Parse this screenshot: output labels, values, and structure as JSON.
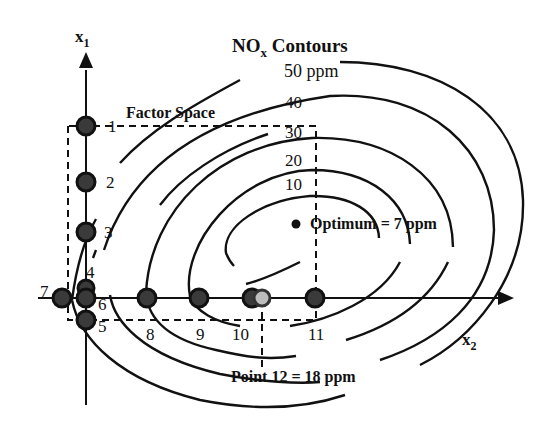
{
  "title": "NO",
  "title_sub": "x",
  "title_rest": " Contours",
  "axes": {
    "x1": {
      "label": "x",
      "sub": "1"
    },
    "x2": {
      "label": "x",
      "sub": "2"
    }
  },
  "factor_space_label": "Factor Space",
  "contours": [
    {
      "label": "50 ppm",
      "value": 50
    },
    {
      "label": "40",
      "value": 40
    },
    {
      "label": "30",
      "value": 30
    },
    {
      "label": "20",
      "value": 20
    },
    {
      "label": "10",
      "value": 10
    }
  ],
  "optimum_label": "Optimum = 7 ppm",
  "point12_label": "Point 12 = 18 ppm",
  "points": [
    {
      "id": "1",
      "label": "1"
    },
    {
      "id": "2",
      "label": "2"
    },
    {
      "id": "3",
      "label": "3"
    },
    {
      "id": "4",
      "label": "4"
    },
    {
      "id": "5",
      "label": "5"
    },
    {
      "id": "6",
      "label": "6"
    },
    {
      "id": "7",
      "label": "7"
    },
    {
      "id": "8",
      "label": "8"
    },
    {
      "id": "9",
      "label": "9"
    },
    {
      "id": "10",
      "label": "10"
    },
    {
      "id": "11",
      "label": "11"
    }
  ]
}
